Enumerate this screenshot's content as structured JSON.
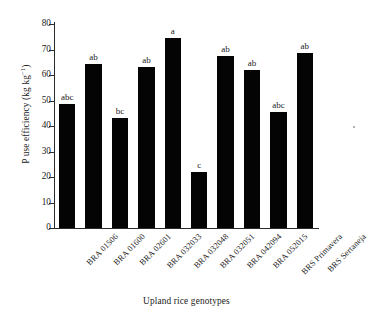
{
  "chart_data": {
    "type": "bar",
    "title": "",
    "xlabel": "Upland rice genotypes",
    "ylabel": "P use efficiency (kg kg⁻¹)",
    "ylabel_main": "P use efficiency (kg kg",
    "ylabel_sup": "−1",
    "ylabel_tail": ")",
    "categories": [
      "BRA 01506",
      "BRA 01600",
      "BRA 02601",
      "BRA 032033",
      "BRA 032048",
      "BRA 032051",
      "BRA 042094",
      "BRA 052015",
      "BRS Primavera",
      "BRS Sertaneja"
    ],
    "values": [
      48.5,
      64.5,
      43.0,
      63.0,
      74.5,
      22.0,
      67.5,
      62.0,
      45.5,
      68.5
    ],
    "annotations": [
      "abc",
      "ab",
      "bc",
      "ab",
      "a",
      "c",
      "ab",
      "ab",
      "abc",
      "ab"
    ],
    "ylim": [
      0,
      80
    ],
    "yticks": [
      0,
      10,
      20,
      30,
      40,
      50,
      60,
      70,
      80
    ],
    "ytick_labels": [
      "0",
      "10",
      "20",
      "30",
      "40",
      "50",
      "60",
      "70",
      "80"
    ],
    "grid": false,
    "legend": false,
    "bar_color": "#040404",
    "axis_color": "#2a2a2a",
    "background": "#ffffff"
  }
}
